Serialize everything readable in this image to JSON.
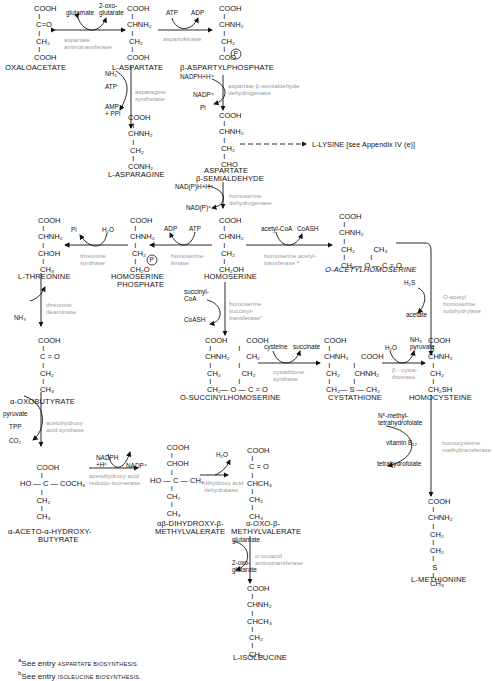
{
  "diagram": {
    "compounds": [
      {
        "id": "oxaloacetate",
        "name": "OXALOACETATE",
        "structure": "COOH\n  |\n C=O\n  |\n CH2\n  |\nCOOH"
      },
      {
        "id": "l-aspartate",
        "name": "L-ASPARTATE",
        "structure": "COOH\n  |\nCHNH2\n  |\n CH2\n  |\nCOOH"
      },
      {
        "id": "b-aspartylphosphate",
        "name": "β-ASPARTYLPHOSPHATE",
        "structure": "COOH\n  |\nCHNH2\n  |\n CH2\n  |\nCOO(P)"
      },
      {
        "id": "l-asparagine",
        "name": "L-ASPARAGINE",
        "structure": "COOH\n  |\nCHNH2\n  |\n CH2\n  |\nCONH2"
      },
      {
        "id": "aspartate-semialdehyde",
        "name": "ASPARTATE β-SEMIALDEHYDE",
        "structure": "COOH\n  |\nCHNH2\n  |\n CH2\n  |\n CHO"
      },
      {
        "id": "l-lysine",
        "name": "L-LYSINE [see Appendix IV (e)]"
      },
      {
        "id": "homoserine",
        "name": "HOMOSERINE",
        "structure": "COOH\n  |\nCHNH2\n  |\n CH2\n  |\nCH2OH"
      },
      {
        "id": "homoserine-phosphate",
        "name": "HOMOSERINE PHOSPHATE",
        "structure": "COOH\n  |\nCHNH2\n  |\n CH2\n  |\nCH2O(P)"
      },
      {
        "id": "l-threonine",
        "name": "L-THREONINE",
        "structure": "COOH\n  |\nCHNH2\n  |\nCHOH\n  |\n CH3"
      },
      {
        "id": "o-acetylhomoserine",
        "name": "O-ACETYLHOMOSERINE",
        "structure": "COOH / CHNH2 / CH2 / CH2-O-C(=O)-CH3"
      },
      {
        "id": "o-succinylhomoserine",
        "name": "O-SUCCINYLHOMOSERINE",
        "structure": "COOH / CHNH2 / CH2 / CH2-O-C(=O)-CH2-CH2-COOH"
      },
      {
        "id": "cystathione",
        "name": "CYSTATHIONE",
        "structure": "COOH / CHNH2 / CH2-S-CH2 / CHNH2 / COOH"
      },
      {
        "id": "homocysteine",
        "name": "HOMOCYSTEINE",
        "structure": "COOH\n  |\nCHNH2\n  |\n CH2\n  |\nCH2SH"
      },
      {
        "id": "a-oxobutyrate",
        "name": "α-OXOBUTYRATE",
        "structure": "COOH\n  |\n C=O\n  |\n CH2\n  |\n CH3"
      },
      {
        "id": "acetohydroxybutyrate",
        "name": "α-ACETO-α-HYDROXY-BUTYRATE",
        "structure": "COOH / HO-C-COCH3 / CH2 / CH3"
      },
      {
        "id": "dihydroxy-methylvalerate",
        "name": "αβ-DIHYDROXY-β-METHYLVALERATE",
        "structure": "COOH / CHOH / HO-C-CH3 / CH2 / CH3"
      },
      {
        "id": "oxo-methylvalerate",
        "name": "α-OXO-β-METHYLVALERATE",
        "structure": "COOH / C=O / CHCH3 / CH2 / CH3"
      },
      {
        "id": "l-isoleucine",
        "name": "L-ISOLEUCINE",
        "structure": "COOH / CHNH2 / CHCH3 / CH2 / CH3"
      },
      {
        "id": "l-methionine",
        "name": "L-METHIONINE",
        "structure": "COOH / CHNH2 / CH2 / CH2 / S / CH3"
      }
    ],
    "enzymes": [
      {
        "id": "asp-aminotransferase",
        "label": "aspartate\naminotransferase",
        "cofactors": [
          "glutamate",
          "2-oxo-\nglutarate"
        ]
      },
      {
        "id": "aspartokinase",
        "label": "aspartokinase",
        "cofactors": [
          "ATP",
          "ADP"
        ]
      },
      {
        "id": "asparagine-synthetase",
        "label": "asparagine\nsynthetase",
        "cofactors": [
          "NH3",
          "ATP",
          "AMP\n+ PPi"
        ]
      },
      {
        "id": "asa-dehydrogenase",
        "label": "aspartate β-semialdehyde\ndehydrogenase",
        "cofactors": [
          "NADPH+H+",
          "NADP+",
          "Pi"
        ]
      },
      {
        "id": "homoserine-dehydrogenase",
        "label": "homoserine\ndehydrogenase",
        "cofactors": [
          "NAD(P)H+H+",
          "NAD(P)+"
        ]
      },
      {
        "id": "homoserine-kinase",
        "label": "homoserine\nkinase",
        "cofactors": [
          "ADP",
          "ATP"
        ]
      },
      {
        "id": "threonine-synthase",
        "label": "threonine\nsynthase",
        "cofactors": [
          "Pi",
          "H2O"
        ]
      },
      {
        "id": "homoserine-acetyltransferase",
        "label": "homoserine acetyl-\ntransferase a",
        "cofactors": [
          "acetyl-CoA",
          "CoASH"
        ]
      },
      {
        "id": "o-acetylhomoserine-sulphydrylase",
        "label": "O-acetyl\nhomoserine\nsulphydrylase",
        "cofactors": [
          "H2S",
          "acetate"
        ]
      },
      {
        "id": "homoserine-succinyltransferase",
        "label": "homoserine\nsuccinyl-\ntransferase c",
        "cofactors": [
          "succinyl-\nCoA",
          "CoASH"
        ]
      },
      {
        "id": "cystathione-synthase",
        "label": "cystathione\nsynthase",
        "cofactors": [
          "cysteine",
          "succinate"
        ]
      },
      {
        "id": "b-cystathionase",
        "label": "β - cysta-\nthionase",
        "cofactors": [
          "H2O",
          "NH3\npyruvate"
        ]
      },
      {
        "id": "threonine-deaminase",
        "label": "threonine\ndeaminase",
        "cofactors": [
          "NH3"
        ]
      },
      {
        "id": "acetohydroxy-acid-synthase",
        "label": "acetohydroxy\nacid synthase",
        "cofactors": [
          "pyruvate",
          "TPP",
          "CO2"
        ]
      },
      {
        "id": "reductoisomerase",
        "label": "acetohydroxy acid\nreducto-isomerase",
        "cofactors": [
          "NADPH\n+H+",
          "NADP+"
        ]
      },
      {
        "id": "dihydroxy-acid-dehydratase",
        "label": "dihydroxy acid\ndehydratase",
        "cofactors": [
          "H2O"
        ]
      },
      {
        "id": "oxoacid-aminotransferase",
        "label": "α-oxoacid\naminotransferase",
        "cofactors": [
          "glutamate",
          "2-oxo-\nglutarate"
        ]
      },
      {
        "id": "homocysteine-methyltransferase",
        "label": "homocysteine\nmethyltransferase",
        "cofactors": [
          "N5-methyl-\ntetrahydrofolate",
          "vitamin B12",
          "tetrahydrofolate"
        ]
      }
    ],
    "footnotes": [
      {
        "mark": "a",
        "prefix": "See entry ",
        "ref": "ASPARTATE BIOSYNTHESIS."
      },
      {
        "mark": "b",
        "prefix": "See entry ",
        "ref": "ISOLEUCINE BIOSYNTHESIS."
      }
    ]
  },
  "labels": {
    "oxaloacetate": {
      "s": "COOH\n  I\n C=O\n  I\n CH₂\n  I\nCOOH",
      "n": "OXALOACETATE"
    },
    "aspartate": {
      "s": "COOH\n  I\nCHNH₂\n  I\n CH₂\n  I\nCOOH",
      "n": "L-ASPARTATE"
    },
    "aspartylphosphate": {
      "s": "COOH\n  I\nCHNH₂\n  I\n CH₂\n  I\nCOO",
      "n": "β-ASPARTYLPHOSPHATE"
    },
    "asparagine": {
      "s": "COOH\n  I\nCHNH₂\n  I\n CH₂\n  I\nCONH₂",
      "n": "L-ASPARAGINE"
    },
    "semialdehyde": {
      "s": "COOH\n  I\nCHNH₂\n  I\n CH₂\n  I\n CHO",
      "n1": "ASPARTATE",
      "n2": "β-SEMIALDEHYDE"
    },
    "lysine": "L-LYSINE [see Appendix IV (e)]",
    "homoserine": {
      "s": "COOH\n  I\nCHNH₂\n  I\n CH₂\n  I\nCH₂OH",
      "n": "HOMOSERINE"
    },
    "hsp": {
      "s": "COOH\n  I\nCHNH₂\n  I\n CH₂\n  I\nCH₂O",
      "n1": "HOMOSERINE",
      "n2": "PHOSPHATE"
    },
    "threonine": {
      "s": "COOH\n  I\nCHNH₂\n  I\nCHOH\n  I\n CH₃",
      "n": "L-THREONINE"
    },
    "oah": {
      "s": "COOH\n  I\nCHNH₂\n  I\n CH₂         CH₃\n  I            I\n CH₂— O — C = O",
      "n": "O-ACETYLHOMOSERINE"
    },
    "osh": {
      "s": "COOH         COOH\n  I             I\nCHNH₂        CH₂\n  I             I\n CH₂          CH₂\n  I             I\n CH₂— O — C = O",
      "n": "O-SUCCINYLHOMOSERINE"
    },
    "cystathione": {
      "s": "COOH\n  I\nCHNH₂      COOH\n  I           I\n CH₂       CHNH₂\n  I           I\n CH₂— S — CH₂",
      "n": "CYSTATHIONE"
    },
    "homocysteine": {
      "s": "COOH\n  I\nCHNH₂\n  I\n CH₂\n  I\nCH₂SH",
      "n": "HOMOCYSTEINE"
    },
    "oxobutyrate": {
      "s": "COOH\n  I\n C = O\n  I\n CH₂\n  I\n CH₃",
      "n": "α-OXOBUTYRATE"
    },
    "ahb": {
      "s": "        COOH\n          I\nHO — C — COCH₃\n          I\n        CH₂\n          I\n        CH₃",
      "n1": "α-ACETO-α-HYDROXY-",
      "n2": "BUTYRATE"
    },
    "dhmv": {
      "s": "        COOH\n          I\n        CHOH\n          I\nHO — C — CH₃\n          I\n        CH₂\n          I\n        CH₃",
      "n1": "αβ-DIHYDROXY-β-",
      "n2": "METHYLVALERATE"
    },
    "omv": {
      "s": "COOH\n  I\n C = O\n  I\nCHCH₃\n  I\n CH₂\n  I\n CH₃",
      "n1": "α-OXO-β-",
      "n2": "METHYLVALERATE"
    },
    "isoleucine": {
      "s": "COOH\n  I\nCHNH₂\n  I\nCHCH₃\n  I\n CH₂\n  I\n CH₃",
      "n": "L-ISOLEUCINE"
    },
    "methionine": {
      "s": "COOH\n  I\nCHNH₂\n  I\n CH₂\n  I\n CH₂\n  I\n  S\n  I\n CH₃",
      "n": "L-METHIONINE"
    },
    "enz": {
      "aat": "aspartate\naminotransferase",
      "ak": "aspartokinase",
      "as": "asparagine\nsynthetase",
      "asadh": "aspartate β-semialdehyde\ndehydrogenase",
      "hdh": "homoserine\ndehydrogenase",
      "hk": "homoserine\nkinase",
      "ts": "threonine\nsynthase",
      "hat": "homoserine acetyl-\ntransferase ᵃ",
      "oahs": "O-acetyl\nhomoserine\nsulphydrylase",
      "hst": "homoserine\nsuccinyl-\ntransferaseᶜ",
      "cs": "cystathione\nsynthase",
      "bc": "β - cysta-\nthionase",
      "td": "threonine\ndeaminase",
      "ahas": "acetohydroxy\nacid synthase",
      "ri": "acetohydroxy acid\nreducto-isomerase",
      "dhad": "dihydroxy acid\ndehydratase",
      "oat": "α-oxoacid\naminotransferase",
      "hmt": "homocysteine\nmethyltransferase"
    },
    "cof": {
      "glu1": "glutamate",
      "og1": "2-oxo-\nglutarate",
      "atp1": "ATP",
      "adp1": "ADP",
      "nh3a": "NH₃",
      "atp2": "ATP",
      "amp": "AMP\n+ PPi",
      "nadph1": "NADPH+H⁺",
      "nadp1": "NADP⁺",
      "pi1": "Pi",
      "nadph2": "NAD(P)H+H⁺",
      "nadp2": "NAD(P)⁺",
      "adp2": "ADP",
      "atp3": "ATP",
      "pi2": "Pi",
      "h2o1": "H₂O",
      "acoa": "acetyl-CoA",
      "coash1": "CoASH",
      "h2s": "H₂S",
      "acetate": "acetate",
      "scoa": "succinyl-\nCoA",
      "coash2": "CoASH",
      "cys": "cysteine",
      "succ": "succinate",
      "h2o2": "H₂O",
      "nh3pyr": "NH₃\npyruvate",
      "nh3b": "NH₃",
      "pyr": "pyruvate",
      "tpp": "TPP",
      "co2": "CO₂",
      "nadph3": "NADPH\n+H⁺",
      "nadp3": "NADP⁺",
      "h2o3": "H₂O",
      "glu2": "glutamate",
      "og2": "2-oxo-\nglutarate",
      "mthf": "N⁵-methyl-\ntetrahydrofolate",
      "b12": "vitamin B₁₂",
      "thf": "tetrahydrofolate"
    },
    "phos": "P",
    "foot": {
      "a_mark": "a",
      "a_pre": "See entry ",
      "a_ref": "ASPARTATE BIOSYNTHESIS.",
      "b_mark": "b",
      "b_pre": "See entry ",
      "b_ref": "ISOLEUCINE BIOSYNTHESIS."
    }
  }
}
